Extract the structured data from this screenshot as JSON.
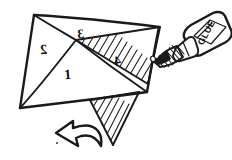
{
  "illustration": {
    "title": "Gluing a paper tetrahedron net",
    "description": "Hand-drawn sketch of a folded paper net with numbered faces, hatched glue tabs, a curved fold arrow and a glue bottle dispensing a drop",
    "style": "hand-drawn black ink line art on white",
    "background_color": "#ffffff",
    "ink_color": "#1a1a1a"
  },
  "net": {
    "name": "tetrahedron-net",
    "face_labels": [
      {
        "id": "face-1",
        "text": "1",
        "orientation": "upright",
        "x": 68,
        "y": 76
      },
      {
        "id": "face-2",
        "text": "2",
        "orientation": "mirrored",
        "x": 44,
        "y": 50
      },
      {
        "id": "face-3",
        "text": "3",
        "orientation": "mirrored",
        "x": 81,
        "y": 35
      },
      {
        "id": "face-4",
        "text": "4",
        "orientation": "mirrored",
        "x": 118,
        "y": 61
      }
    ],
    "tabs": [
      {
        "id": "glue-tab-upper",
        "hatched": true,
        "position": "upper-right"
      },
      {
        "id": "glue-tab-lower",
        "hatched": true,
        "position": "lower-center"
      }
    ]
  },
  "arrow": {
    "name": "fold-direction-arrow",
    "direction": "left",
    "shape": "curved block arrow"
  },
  "glue_bottle": {
    "name": "glue-bottle",
    "label_text": "GLUE",
    "label_orientation": "vertical bottom-to-top",
    "nozzle": "conical shaded tip",
    "drop": {
      "name": "glue-drop",
      "visible": true
    }
  }
}
